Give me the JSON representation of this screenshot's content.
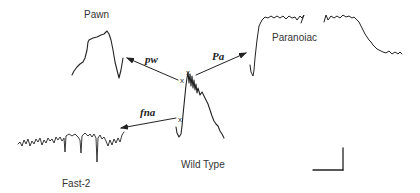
{
  "diagram": {
    "center_trace": {
      "label": "Wild Type"
    },
    "mutants": [
      {
        "id": "pawn",
        "label": "Pawn",
        "gene": "pw"
      },
      {
        "id": "paranoiac",
        "label": "Paranoiac",
        "gene": "Pa"
      },
      {
        "id": "fast2",
        "label": "Fast-2",
        "gene": "fna"
      }
    ],
    "markers": {
      "stimulus_mark": "x"
    },
    "scale_bar": {
      "present": true
    }
  },
  "colors": {
    "ink": "#222222",
    "text": "#333333",
    "background": "#ffffff"
  }
}
